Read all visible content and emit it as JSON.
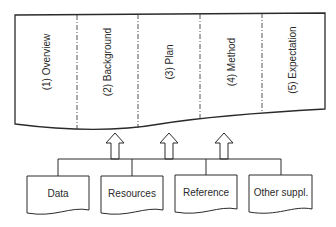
{
  "diagram": {
    "sections": [
      {
        "label": "(1) Overview"
      },
      {
        "label": "(2) Background"
      },
      {
        "label": "(3) Plan"
      },
      {
        "label": "(4) Method"
      },
      {
        "label": "(5) Expectation"
      }
    ],
    "sources": [
      {
        "label": "Data"
      },
      {
        "label": "Resources"
      },
      {
        "label": "Reference"
      },
      {
        "label": "Other suppl."
      }
    ],
    "colors": {
      "stroke": "#2a2a2a",
      "background": "#ffffff"
    }
  }
}
